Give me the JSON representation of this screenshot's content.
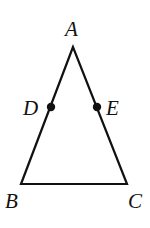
{
  "diagram": {
    "type": "triangle",
    "colors": {
      "stroke": "#111111",
      "point": "#111111",
      "background": "#ffffff"
    },
    "vertices": {
      "A": {
        "label": "A",
        "x": 73,
        "y": 47
      },
      "B": {
        "label": "B",
        "x": 21,
        "y": 184
      },
      "C": {
        "label": "C",
        "x": 127,
        "y": 184
      }
    },
    "points": {
      "D": {
        "label": "D",
        "x": 51,
        "y": 107,
        "on_segment": "AB"
      },
      "E": {
        "label": "E",
        "x": 97,
        "y": 107,
        "on_segment": "AC"
      }
    },
    "segments": [
      "AB",
      "AC",
      "BC"
    ]
  }
}
